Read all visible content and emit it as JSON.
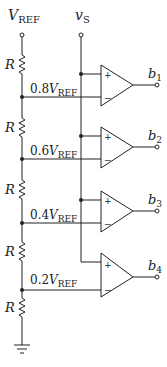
{
  "diagram": {
    "supply_label": {
      "main": "V",
      "sub": "REF"
    },
    "input_label": {
      "main": "v",
      "sub": "S"
    },
    "resistor_label": "R",
    "taps": [
      {
        "coef": "0.8",
        "main": "V",
        "sub": "REF"
      },
      {
        "coef": "0.6",
        "main": "V",
        "sub": "REF"
      },
      {
        "coef": "0.4",
        "main": "V",
        "sub": "REF"
      },
      {
        "coef": "0.2",
        "main": "V",
        "sub": "REF"
      }
    ],
    "outputs": [
      {
        "main": "b",
        "sub": "1"
      },
      {
        "main": "b",
        "sub": "2"
      },
      {
        "main": "b",
        "sub": "3"
      },
      {
        "main": "b",
        "sub": "4"
      }
    ],
    "plus_sign": "+",
    "minus_sign": "−"
  }
}
